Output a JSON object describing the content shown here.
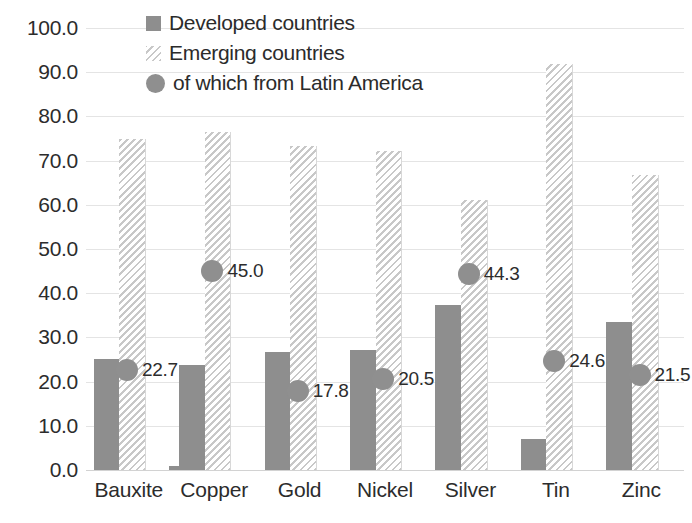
{
  "chart_data": {
    "type": "bar",
    "title": "",
    "xlabel": "",
    "ylabel": "",
    "ylim": [
      0,
      100
    ],
    "ytick_step": 10,
    "grid": true,
    "legend_position": "top-left",
    "categories": [
      "Bauxite",
      "Copper",
      "Gold",
      "Nickel",
      "Silver",
      "Tin",
      "Zinc"
    ],
    "ytick_labels": [
      "0.0",
      "10.0",
      "20.0",
      "30.0",
      "40.0",
      "50.0",
      "60.0",
      "70.0",
      "80.0",
      "90.0",
      "100.0"
    ],
    "series": [
      {
        "name": "Developed countries",
        "type": "bar",
        "color": "#8e8e8e",
        "values": [
          25.2,
          23.7,
          26.8,
          27.1,
          37.4,
          7.0,
          33.6
        ]
      },
      {
        "name": "Emerging countries",
        "type": "bar",
        "pattern": "diagonal-hatch",
        "color": "#c8c8c8",
        "values": [
          74.8,
          76.5,
          73.4,
          72.1,
          61.2,
          91.8,
          66.7
        ]
      },
      {
        "name": "of which from Latin America",
        "type": "scatter",
        "color": "#8f8f8f",
        "values": [
          22.7,
          45.0,
          17.8,
          20.5,
          44.3,
          24.6,
          21.5
        ],
        "labels": [
          "22.7",
          "45.0",
          "17.8",
          "20.5",
          "44.3",
          "24.6",
          "21.5"
        ]
      }
    ],
    "extra_marks": [
      {
        "category": "Copper",
        "series": "Developed countries",
        "note": "thin sliver bar at group left",
        "value": 1.0
      }
    ]
  },
  "legend": {
    "items": [
      {
        "label": "Developed countries",
        "marker": "square-solid-icon"
      },
      {
        "label": "Emerging countries",
        "marker": "square-hatched-icon"
      },
      {
        "label": "of which from Latin America",
        "marker": "circle-dot-icon"
      }
    ]
  },
  "colors": {
    "developed": "#8e8e8e",
    "emerging_hatch": "#c8c8c8",
    "latin_america_dot": "#8f8f8f",
    "gridline": "#e4e4e4",
    "text": "#2c2c2c",
    "background": "#ffffff"
  }
}
